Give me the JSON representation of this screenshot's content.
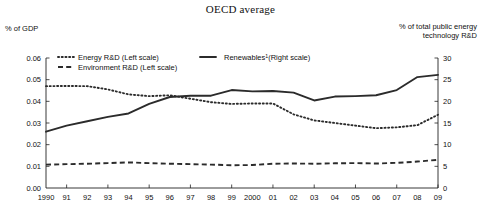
{
  "chart_data": {
    "type": "line",
    "title": "OECD average",
    "ylabel_left": "% of GDP",
    "ylabel_right": "% of total public energy technology R&D",
    "xlabel": "",
    "grid": false,
    "legend_position": "inside-top",
    "x": [
      1990,
      1991,
      1992,
      1993,
      1994,
      1995,
      1996,
      1997,
      1998,
      1999,
      2000,
      2001,
      2002,
      2003,
      2004,
      2005,
      2006,
      2007,
      2008,
      2009
    ],
    "tick_labels": [
      "1990",
      "91",
      "92",
      "93",
      "94",
      "95",
      "96",
      "97",
      "98",
      "99",
      "2000",
      "01",
      "02",
      "03",
      "04",
      "05",
      "06",
      "07",
      "08",
      "09"
    ],
    "ylim_left": [
      0.0,
      0.06
    ],
    "yticks_left": [
      "0.00",
      "0.01",
      "0.02",
      "0.03",
      "0.04",
      "0.05",
      "0.06"
    ],
    "ylim_right": [
      0,
      30
    ],
    "yticks_right": [
      "0",
      "5",
      "10",
      "15",
      "20",
      "25",
      "30"
    ],
    "series": [
      {
        "name": "Energy R&D (Left scale)",
        "axis": "left",
        "style": "dotted",
        "values": [
          0.047,
          0.0471,
          0.047,
          0.0455,
          0.0432,
          0.0424,
          0.0428,
          0.0412,
          0.0396,
          0.0388,
          0.039,
          0.039,
          0.034,
          0.0312,
          0.03,
          0.0288,
          0.0276,
          0.028,
          0.029,
          0.0338
        ]
      },
      {
        "name": "Environment R&D (Left scale)",
        "axis": "left",
        "style": "dashed",
        "values": [
          0.0108,
          0.011,
          0.0112,
          0.0115,
          0.0118,
          0.0115,
          0.0112,
          0.011,
          0.0108,
          0.0105,
          0.0106,
          0.0112,
          0.0113,
          0.0112,
          0.0114,
          0.0115,
          0.0113,
          0.0116,
          0.0122,
          0.013
        ]
      },
      {
        "name": "Renewables¹(Right scale)",
        "axis": "right",
        "style": "solid",
        "values": [
          13.0,
          14.4,
          15.4,
          16.4,
          17.2,
          19.4,
          21.0,
          21.3,
          21.3,
          22.6,
          22.3,
          22.4,
          22.0,
          20.2,
          21.1,
          21.2,
          21.4,
          22.6,
          25.6,
          26.1
        ]
      }
    ],
    "legend": [
      {
        "label": "Energy R&D (Left scale)",
        "style": "dotted"
      },
      {
        "label": "Environment R&D (Left scale)",
        "style": "dashed"
      },
      {
        "label": "Renewables",
        "sup": "1",
        "label_tail": "(Right scale)",
        "style": "solid"
      }
    ]
  }
}
